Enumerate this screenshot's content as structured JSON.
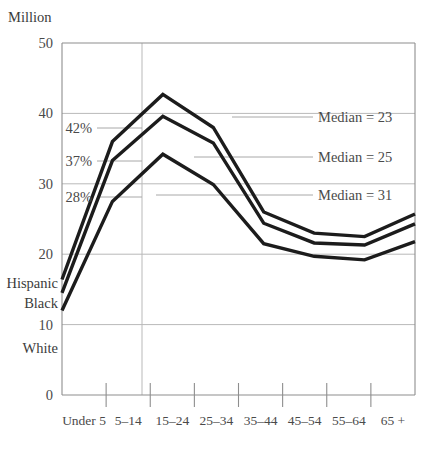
{
  "chart_data": {
    "type": "line",
    "title": "",
    "subtitle": "",
    "ylabel": "Million",
    "xlabel": "",
    "categories": [
      "Under 5",
      "5–14",
      "15–24",
      "25–34",
      "35–44",
      "45–54",
      "55–64",
      "65 +"
    ],
    "ylim": [
      0,
      50
    ],
    "yticks": [
      0,
      10,
      20,
      30,
      40,
      50
    ],
    "ytick_labels": [
      "0",
      "10",
      "20",
      "30",
      "40",
      "50"
    ],
    "grid": "horizontal-and-one-vertical",
    "legend_position": "inline-left-and-right",
    "series": [
      {
        "name": "Hispanic",
        "values": [
          16.4,
          36.0,
          42.7,
          38.0,
          26.0,
          23.0,
          22.5,
          25.7
        ],
        "start_label": "Hispanic",
        "pct_label": "42%",
        "median_label": "Median = 23"
      },
      {
        "name": "Black",
        "values": [
          14.5,
          33.3,
          39.6,
          35.8,
          24.4,
          21.6,
          21.3,
          24.3
        ],
        "start_label": "Black",
        "pct_label": "37%",
        "median_label": "Median = 25"
      },
      {
        "name": "White",
        "values": [
          12.0,
          27.5,
          34.2,
          29.9,
          21.5,
          19.7,
          19.2,
          21.8
        ],
        "start_label": "White",
        "pct_label": "28%",
        "median_label": "Median = 31"
      }
    ],
    "annotations": {
      "percent_labels": [
        "42%",
        "37%",
        "28%"
      ],
      "median_labels": [
        "Median = 23",
        "Median = 25",
        "Median = 31"
      ],
      "series_labels": [
        "Hispanic",
        "Black",
        "White"
      ]
    },
    "colors": {
      "line": "#1c1c1c",
      "grid": "#b9b9b9",
      "axis": "#8e8e8e",
      "text": "#4a4a4a",
      "background": "#ffffff"
    }
  }
}
